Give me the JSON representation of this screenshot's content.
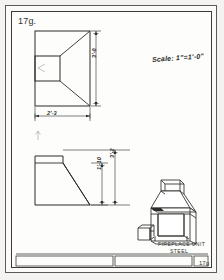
{
  "sheet": {
    "label": "17g.",
    "scale_note": "Scale: 1\"=1'-0\"",
    "title_block_number": "17g"
  },
  "views": {
    "front_elevation": {
      "name": "front-elevation",
      "dimensions": {
        "height": "3'-0",
        "width": "2'-3"
      }
    },
    "side_elevation": {
      "name": "side-elevation",
      "dimensions": {
        "overall_height": "3'-2",
        "opening_height": "1'-10"
      }
    },
    "pictorial": {
      "name": "pictorial-view",
      "caption_line_1": "FIREPLACE UNIT",
      "caption_line_2": "STEEL"
    }
  },
  "colors": {
    "paper": "#fdfdfb",
    "sheet_ground": "#f4f3f1",
    "line": "#2b2b29",
    "frame": "#3b3b39"
  }
}
